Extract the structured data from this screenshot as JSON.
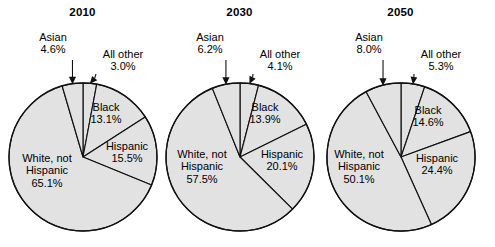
{
  "figure": {
    "background": "#ffffff",
    "slice_fill": "#e2e2e2",
    "slice_stroke": "#111111"
  },
  "chart_data": {
    "type": "pie",
    "title": "",
    "charts": [
      {
        "title": "2010",
        "categories": [
          "All other",
          "Black",
          "Hispanic",
          "White, not Hispanic",
          "Asian"
        ],
        "values": [
          3.0,
          13.1,
          15.5,
          65.1,
          4.6
        ],
        "labels": [
          {
            "name": "All other",
            "value": "3.0%",
            "placement": "outside"
          },
          {
            "name": "Black",
            "value": "13.1%",
            "placement": "inside"
          },
          {
            "name": "Hispanic",
            "value": "15.5%",
            "placement": "inside"
          },
          {
            "name": "White, not Hispanic",
            "value": "65.1%",
            "placement": "inside"
          },
          {
            "name": "Asian",
            "value": "4.6%",
            "placement": "outside"
          }
        ]
      },
      {
        "title": "2030",
        "categories": [
          "All other",
          "Black",
          "Hispanic",
          "White, not Hispanic",
          "Asian"
        ],
        "values": [
          4.1,
          13.9,
          20.1,
          57.5,
          6.2
        ],
        "labels": [
          {
            "name": "All other",
            "value": "4.1%",
            "placement": "outside"
          },
          {
            "name": "Black",
            "value": "13.9%",
            "placement": "inside"
          },
          {
            "name": "Hispanic",
            "value": "20.1%",
            "placement": "inside"
          },
          {
            "name": "White, not Hispanic",
            "value": "57.5%",
            "placement": "inside"
          },
          {
            "name": "Asian",
            "value": "6.2%",
            "placement": "outside"
          }
        ]
      },
      {
        "title": "2050",
        "categories": [
          "All other",
          "Black",
          "Hispanic",
          "White, not Hispanic",
          "Asian"
        ],
        "values": [
          5.3,
          14.6,
          24.4,
          50.1,
          8.0
        ],
        "labels": [
          {
            "name": "All other",
            "value": "5.3%",
            "placement": "outside"
          },
          {
            "name": "Black",
            "value": "14.6%",
            "placement": "inside"
          },
          {
            "name": "Hispanic",
            "value": "24.4%",
            "placement": "inside"
          },
          {
            "name": "White, not Hispanic",
            "value": "50.1%",
            "placement": "inside"
          },
          {
            "name": "Asian",
            "value": "8.0%",
            "placement": "outside"
          }
        ]
      }
    ],
    "legend": "none",
    "grid": false
  },
  "panels": {
    "p0": {
      "title": "2010",
      "asian_name": "Asian",
      "asian_val": "4.6%",
      "allother_name": "All other",
      "allother_val": "3.0%",
      "black_name": "Black",
      "black_val": "13.1%",
      "hisp_name": "Hispanic",
      "hisp_val": "15.5%",
      "white_name1": "White, not",
      "white_name2": "Hispanic",
      "white_val": "65.1%"
    },
    "p1": {
      "title": "2030",
      "asian_name": "Asian",
      "asian_val": "6.2%",
      "allother_name": "All other",
      "allother_val": "4.1%",
      "black_name": "Black",
      "black_val": "13.9%",
      "hisp_name": "Hispanic",
      "hisp_val": "20.1%",
      "white_name1": "White, not",
      "white_name2": "Hispanic",
      "white_val": "57.5%"
    },
    "p2": {
      "title": "2050",
      "asian_name": "Asian",
      "asian_val": "8.0%",
      "allother_name": "All other",
      "allother_val": "5.3%",
      "black_name": "Black",
      "black_val": "14.6%",
      "hisp_name": "Hispanic",
      "hisp_val": "24.4%",
      "white_name1": "White, not",
      "white_name2": "Hispanic",
      "white_val": "50.1%"
    }
  }
}
